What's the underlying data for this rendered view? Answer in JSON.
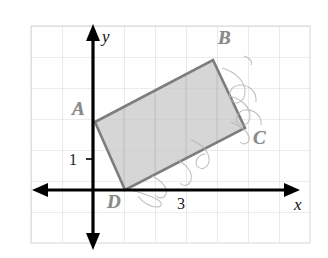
{
  "figure": {
    "kind": "coordinate-grid-diagram",
    "width": 328,
    "height": 258,
    "background_color": "#ffffff",
    "grid": {
      "line_color": "#d9d9de",
      "cell_size": 31,
      "left": 31,
      "top": 26,
      "right": 310,
      "bottom": 245,
      "columns": 9,
      "rows": 7
    },
    "axes": {
      "color": "#000000",
      "stroke_width": 3.2,
      "origin": {
        "x": 93,
        "y": 190
      },
      "x_axis_label": "x",
      "y_axis_label": "y",
      "x_axis_label_pos": {
        "x": 294,
        "y": 196
      },
      "y_axis_label_pos": {
        "x": 102,
        "y": 28
      }
    },
    "ticks": [
      {
        "label": "1",
        "axis": "y",
        "value": 1,
        "pos": {
          "x": 69,
          "y": 152
        }
      },
      {
        "label": "3",
        "axis": "x",
        "value": 3,
        "pos": {
          "x": 177,
          "y": 196
        }
      }
    ],
    "shape": {
      "name": "rectangle-abcd",
      "fill_color": "#c6c6c6",
      "fill_opacity": 0.72,
      "stroke_color": "#7d7d7d",
      "stroke_width": 2.6,
      "vertices": [
        {
          "label": "A",
          "x": 95,
          "y": 122,
          "label_pos": {
            "x": 72,
            "y": 99
          }
        },
        {
          "label": "B",
          "x": 213,
          "y": 60,
          "label_pos": {
            "x": 218,
            "y": 28
          }
        },
        {
          "label": "C",
          "x": 245,
          "y": 128,
          "label_pos": {
            "x": 253,
            "y": 128
          }
        },
        {
          "label": "D",
          "x": 125,
          "y": 190,
          "label_pos": {
            "x": 107,
            "y": 192
          }
        }
      ]
    },
    "annotations": {
      "pencil_marks_color": "#b3b3b8",
      "description": "faint hand-drawn pencil loops near vertex C and along edge DC"
    }
  }
}
